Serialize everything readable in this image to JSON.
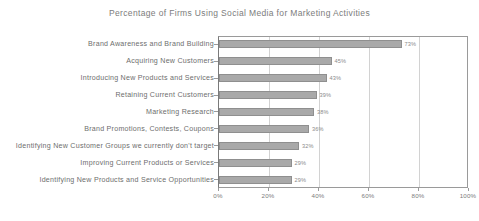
{
  "chart_data": {
    "type": "bar",
    "orientation": "horizontal",
    "title": "Percentage of Firms Using Social Media for Marketing Activities",
    "xlabel": "",
    "ylabel": "",
    "xlim": [
      0,
      100
    ],
    "grid": true,
    "legend": "none",
    "bar_color": "#a9a9a9",
    "bar_border_color": "#8f8f8f",
    "categories": [
      "Brand Awareness and Brand Building",
      "Acquiring New Customers",
      "Introducing New Products and Services",
      "Retaining Current Customers",
      "Marketing Research",
      "Brand Promotions, Contests, Coupons",
      "Identifying New Customer Groups we currently don't target",
      "Improving Current Products or Services",
      "Identifying New Products and Service Opportunities"
    ],
    "values": [
      73,
      45,
      43,
      39,
      38,
      36,
      32,
      29,
      29
    ],
    "value_labels": [
      "73%",
      "45%",
      "43%",
      "39%",
      "38%",
      "36%",
      "32%",
      "29%",
      "29%"
    ],
    "xticks": [
      0,
      20,
      40,
      60,
      80,
      100
    ],
    "xtick_labels": [
      "0%",
      "20%",
      "40%",
      "60%",
      "80%",
      "100%"
    ]
  }
}
